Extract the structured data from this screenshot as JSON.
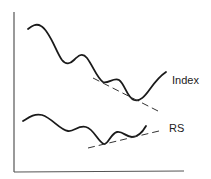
{
  "diagram": {
    "series": [
      {
        "name": "Index",
        "label": "Index",
        "trendline": "descending lows",
        "color": "#1a1a1a"
      },
      {
        "name": "RS",
        "label": "RS",
        "trendline": "ascending lows",
        "color": "#1a1a1a"
      }
    ],
    "axes": {
      "x_label": "",
      "y_label": ""
    }
  }
}
